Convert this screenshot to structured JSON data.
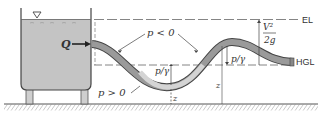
{
  "figure": {
    "labels": {
      "flow": "Q",
      "negative_pressure": "p < 0",
      "positive_pressure": "p > 0",
      "pressure_head_1": "p/γ",
      "pressure_head_2": "p/γ",
      "elevation_1": "z",
      "elevation_2": "z",
      "velocity_head_num": "V²",
      "velocity_head_den": "2g",
      "energy_line": "EL",
      "hydraulic_grade_line": "HGL"
    },
    "colors": {
      "water": "#c8c8c8",
      "pipe_fill": "#9a9a9a",
      "pipe_fluid_light": "#d4d4d4",
      "line": "#444444",
      "ground_hatch": "#666666"
    }
  }
}
